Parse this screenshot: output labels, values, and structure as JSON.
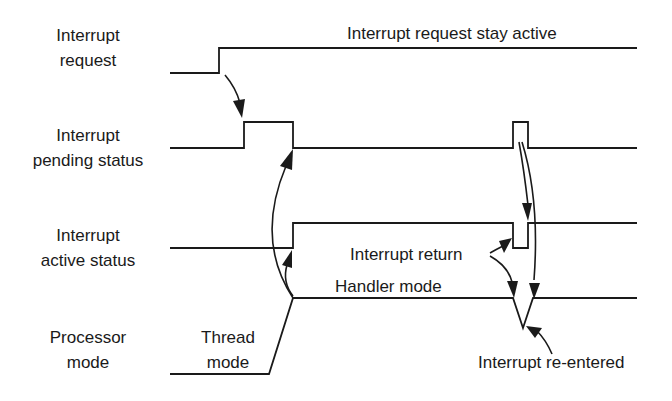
{
  "diagram": {
    "type": "timing-diagram",
    "signals": [
      {
        "id": "irq",
        "label_lines": [
          "Interrupt",
          "request"
        ]
      },
      {
        "id": "pending",
        "label_lines": [
          "Interrupt",
          "pending status"
        ]
      },
      {
        "id": "active",
        "label_lines": [
          "Interrupt",
          "active status"
        ]
      },
      {
        "id": "mode",
        "label_lines": [
          "Processor",
          "mode"
        ]
      }
    ],
    "annotations": {
      "irq_stay_active": "Interrupt request stay active",
      "interrupt_return": "Interrupt return",
      "handler_mode": "Handler mode",
      "thread_mode_lines": [
        "Thread",
        "mode"
      ],
      "interrupt_reentered": "Interrupt re-entered"
    },
    "colors": {
      "line": "#1a1a1a",
      "background": "#ffffff"
    }
  }
}
